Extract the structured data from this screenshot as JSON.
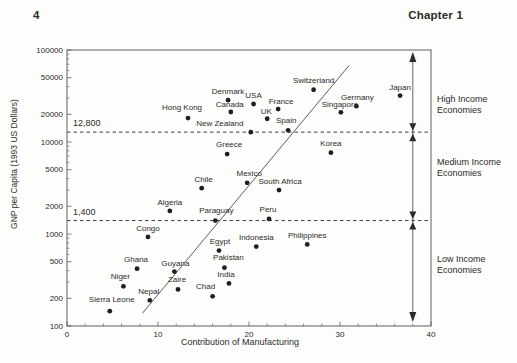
{
  "page": {
    "page_number": "4",
    "chapter_header": "Chapter 1"
  },
  "chart_data": {
    "type": "scatter",
    "title": "",
    "xlabel": "Contribution of Manufacturing",
    "ylabel": "GNP per Capita (1993 US Dollars)",
    "x_scale": "linear",
    "y_scale": "log",
    "xlim": [
      0,
      40
    ],
    "ylim": [
      100,
      100000
    ],
    "x_major_ticks": [
      0,
      10,
      20,
      30,
      40
    ],
    "x_minor_step": 2,
    "y_major_ticks": [
      100000,
      50000,
      20000,
      10000,
      5000,
      2000,
      1000,
      500,
      200,
      100
    ],
    "grid": false,
    "marker": {
      "shape": "circle",
      "radius": 2.4,
      "color": "#1f1f1f"
    },
    "points": [
      {
        "name": "Japan",
        "manufacturing_pct": 36.6,
        "gnp_per_capita": 32000,
        "label_dx": 0,
        "label_dy": -9
      },
      {
        "name": "Switzerland",
        "manufacturing_pct": 27.1,
        "gnp_per_capita": 37000,
        "label_dx": 0,
        "label_dy": -10
      },
      {
        "name": "Germany",
        "manufacturing_pct": 31.8,
        "gnp_per_capita": 24500,
        "label_dx": 1,
        "label_dy": -9
      },
      {
        "name": "Singapore",
        "manufacturing_pct": 30.1,
        "gnp_per_capita": 21000,
        "label_dx": -1,
        "label_dy": -8
      },
      {
        "name": "Denmark",
        "manufacturing_pct": 17.7,
        "gnp_per_capita": 28500,
        "label_dx": 0,
        "label_dy": -9
      },
      {
        "name": "Canada",
        "manufacturing_pct": 18.0,
        "gnp_per_capita": 21200,
        "label_dx": -1,
        "label_dy": -8
      },
      {
        "name": "USA",
        "manufacturing_pct": 20.5,
        "gnp_per_capita": 25900,
        "label_dx": 0,
        "label_dy": -9
      },
      {
        "name": "France",
        "manufacturing_pct": 23.2,
        "gnp_per_capita": 22800,
        "label_dx": 3,
        "label_dy": -8
      },
      {
        "name": "UK",
        "manufacturing_pct": 22.0,
        "gnp_per_capita": 17900,
        "label_dx": -1,
        "label_dy": -8
      },
      {
        "name": "Hong Kong",
        "manufacturing_pct": 13.3,
        "gnp_per_capita": 18200,
        "label_dx": -6,
        "label_dy": -11
      },
      {
        "name": "New Zealand",
        "manufacturing_pct": 20.2,
        "gnp_per_capita": 12800,
        "label_dx": -31,
        "label_dy": -9
      },
      {
        "name": "Spain",
        "manufacturing_pct": 24.3,
        "gnp_per_capita": 13400,
        "label_dx": -2,
        "label_dy": -10
      },
      {
        "name": "Korea",
        "manufacturing_pct": 29.0,
        "gnp_per_capita": 7650,
        "label_dx": 0,
        "label_dy": -10
      },
      {
        "name": "Greece",
        "manufacturing_pct": 17.6,
        "gnp_per_capita": 7400,
        "label_dx": 2,
        "label_dy": -10
      },
      {
        "name": "Mexico",
        "manufacturing_pct": 19.8,
        "gnp_per_capita": 3600,
        "label_dx": 2,
        "label_dy": -10
      },
      {
        "name": "South Africa",
        "manufacturing_pct": 23.3,
        "gnp_per_capita": 3000,
        "label_dx": 1,
        "label_dy": -9
      },
      {
        "name": "Chile",
        "manufacturing_pct": 14.8,
        "gnp_per_capita": 3150,
        "label_dx": 2,
        "label_dy": -9
      },
      {
        "name": "Algeria",
        "manufacturing_pct": 11.3,
        "gnp_per_capita": 1780,
        "label_dx": 0,
        "label_dy": -9
      },
      {
        "name": "Paraguay",
        "manufacturing_pct": 16.3,
        "gnp_per_capita": 1400,
        "label_dx": 1,
        "label_dy": -11
      },
      {
        "name": "Peru",
        "manufacturing_pct": 22.2,
        "gnp_per_capita": 1460,
        "label_dx": -1,
        "label_dy": -10
      },
      {
        "name": "Congo",
        "manufacturing_pct": 8.9,
        "gnp_per_capita": 930,
        "label_dx": 0,
        "label_dy": -9
      },
      {
        "name": "Philippines",
        "manufacturing_pct": 26.4,
        "gnp_per_capita": 770,
        "label_dx": 0,
        "label_dy": -9
      },
      {
        "name": "Indonesia",
        "manufacturing_pct": 20.8,
        "gnp_per_capita": 730,
        "label_dx": 0,
        "label_dy": -10
      },
      {
        "name": "Egypt",
        "manufacturing_pct": 16.7,
        "gnp_per_capita": 660,
        "label_dx": 1,
        "label_dy": -10
      },
      {
        "name": "Pakistan",
        "manufacturing_pct": 17.3,
        "gnp_per_capita": 430,
        "label_dx": 4,
        "label_dy": -11
      },
      {
        "name": "Ghana",
        "manufacturing_pct": 7.7,
        "gnp_per_capita": 420,
        "label_dx": -1,
        "label_dy": -10
      },
      {
        "name": "Guyana",
        "manufacturing_pct": 11.8,
        "gnp_per_capita": 390,
        "label_dx": 1,
        "label_dy": -9
      },
      {
        "name": "India",
        "manufacturing_pct": 17.8,
        "gnp_per_capita": 290,
        "label_dx": -3,
        "label_dy": -9
      },
      {
        "name": "Niger",
        "manufacturing_pct": 6.2,
        "gnp_per_capita": 270,
        "label_dx": -3,
        "label_dy": -10
      },
      {
        "name": "Zaire",
        "manufacturing_pct": 12.2,
        "gnp_per_capita": 250,
        "label_dx": -1,
        "label_dy": -10
      },
      {
        "name": "Chad",
        "manufacturing_pct": 16.0,
        "gnp_per_capita": 210,
        "label_dx": -7,
        "label_dy": -10
      },
      {
        "name": "Nepal",
        "manufacturing_pct": 9.1,
        "gnp_per_capita": 190,
        "label_dx": -1,
        "label_dy": -9
      },
      {
        "name": "Sierra Leone",
        "manufacturing_pct": 4.7,
        "gnp_per_capita": 145,
        "label_dx": 2,
        "label_dy": -12
      }
    ],
    "thresholds": [
      {
        "label": "12,800",
        "value": 12800
      },
      {
        "label": "1,400",
        "value": 1400
      }
    ],
    "income_bands": [
      {
        "name": "high-income",
        "lines": [
          "High Income",
          "Economies"
        ],
        "gnp_range": [
          12800,
          100000
        ],
        "label_center_y_px": 104
      },
      {
        "name": "medium-income",
        "lines": [
          "Medium Income",
          "Economies"
        ],
        "gnp_range": [
          1400,
          12800
        ],
        "label_center_y_px": 167
      },
      {
        "name": "low-income",
        "lines": [
          "Low Income",
          "Economies"
        ],
        "gnp_range": [
          100,
          1400
        ],
        "label_center_y_px": 264
      }
    ],
    "range_bracket": {
      "x_value": 38
    },
    "trend_line": {
      "from": {
        "x": 8.3,
        "gnp": 138
      },
      "to": {
        "x": 31.0,
        "gnp": 68000
      }
    },
    "colors": {
      "ink": "#2b2b2b",
      "axis": "#4d4d4d",
      "dot": "#1f1f1f",
      "background": "#fdfdfb"
    }
  }
}
